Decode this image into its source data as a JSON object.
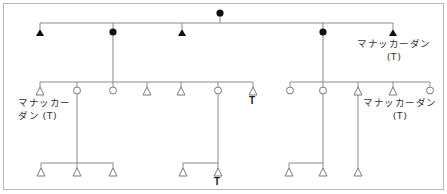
{
  "diagram": {
    "type": "kinship-chart",
    "legend_hint": {
      "filled_circle": "female (deceased)",
      "filled_triangle": "male (deceased)",
      "open_circle": "female",
      "open_triangle": "male"
    },
    "labels": {
      "gen2_right": [
        "マナッカーダン",
        "(T)"
      ],
      "gen3_left": [
        "マナッカー",
        "ダン (T)"
      ],
      "gen3_right": [
        "マナッカーダン",
        "(T)"
      ],
      "t_mark_gen3": "T",
      "t_mark_gen4": "T"
    },
    "nodes": [
      {
        "id": "g1-root",
        "shape": "circle",
        "filled": true,
        "x": 220,
        "y": 13
      },
      {
        "id": "g2-1",
        "shape": "triangle",
        "filled": true,
        "x": 40,
        "y": 33
      },
      {
        "id": "g2-2",
        "shape": "circle",
        "filled": true,
        "x": 113,
        "y": 32
      },
      {
        "id": "g2-3",
        "shape": "triangle",
        "filled": true,
        "x": 182,
        "y": 33
      },
      {
        "id": "g2-4",
        "shape": "circle",
        "filled": true,
        "x": 323,
        "y": 32
      },
      {
        "id": "g2-5",
        "shape": "triangle",
        "filled": true,
        "x": 393,
        "y": 33
      },
      {
        "id": "g3-1",
        "shape": "triangle",
        "filled": false,
        "x": 40,
        "y": 91
      },
      {
        "id": "g3-2",
        "shape": "circle",
        "filled": false,
        "x": 77,
        "y": 90
      },
      {
        "id": "g3-3",
        "shape": "circle",
        "filled": false,
        "x": 113,
        "y": 90
      },
      {
        "id": "g3-4",
        "shape": "triangle",
        "filled": false,
        "x": 147,
        "y": 91
      },
      {
        "id": "g3-5",
        "shape": "triangle",
        "filled": false,
        "x": 181,
        "y": 91
      },
      {
        "id": "g3-6",
        "shape": "circle",
        "filled": false,
        "x": 218,
        "y": 90
      },
      {
        "id": "g3-7",
        "shape": "triangle",
        "filled": false,
        "x": 253,
        "y": 91
      },
      {
        "id": "g3-8",
        "shape": "circle",
        "filled": false,
        "x": 290,
        "y": 90
      },
      {
        "id": "g3-9",
        "shape": "circle",
        "filled": false,
        "x": 323,
        "y": 90
      },
      {
        "id": "g3-10",
        "shape": "triangle",
        "filled": false,
        "x": 358,
        "y": 91
      },
      {
        "id": "g3-11",
        "shape": "triangle",
        "filled": false,
        "x": 393,
        "y": 91
      },
      {
        "id": "g3-12",
        "shape": "circle",
        "filled": false,
        "x": 430,
        "y": 90
      },
      {
        "id": "g4-1",
        "shape": "triangle",
        "filled": false,
        "x": 41,
        "y": 172
      },
      {
        "id": "g4-2",
        "shape": "triangle",
        "filled": false,
        "x": 77,
        "y": 172
      },
      {
        "id": "g4-3",
        "shape": "triangle",
        "filled": false,
        "x": 113,
        "y": 172
      },
      {
        "id": "g4-4",
        "shape": "triangle",
        "filled": false,
        "x": 183,
        "y": 172
      },
      {
        "id": "g4-5",
        "shape": "triangle",
        "filled": false,
        "x": 218,
        "y": 172
      },
      {
        "id": "g4-6",
        "shape": "triangle",
        "filled": false,
        "x": 289,
        "y": 172
      },
      {
        "id": "g4-7",
        "shape": "triangle",
        "filled": false,
        "x": 323,
        "y": 172
      },
      {
        "id": "g4-8",
        "shape": "triangle",
        "filled": false,
        "x": 358,
        "y": 172
      }
    ],
    "colors": {
      "line": "#8a8a8a",
      "filled": "#111111",
      "open_stroke": "#7a7a7a",
      "frame": "#b8b8b8"
    }
  }
}
